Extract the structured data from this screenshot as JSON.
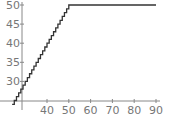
{
  "chart_data": {
    "type": "line",
    "title": "",
    "xlabel": "",
    "ylabel": "",
    "x_ticks": [
      40,
      50,
      60,
      70,
      80,
      90
    ],
    "y_ticks": [
      30,
      35,
      40,
      45,
      50
    ],
    "xlim": [
      27,
      90
    ],
    "ylim": [
      24.7,
      50.5
    ],
    "grid": false,
    "legend": null,
    "series": [
      {
        "name": "step",
        "style": "staircase",
        "x": [
          24,
          25,
          26,
          27,
          28,
          29,
          30,
          31,
          32,
          33,
          34,
          35,
          36,
          37,
          38,
          39,
          40,
          41,
          42,
          43,
          44,
          45,
          46,
          47,
          48,
          49,
          50,
          90
        ],
        "y": [
          24,
          25,
          26,
          27,
          28,
          29,
          30,
          31,
          32,
          33,
          34,
          35,
          36,
          37,
          38,
          39,
          40,
          41,
          42,
          43,
          44,
          45,
          46,
          47,
          48,
          49,
          50,
          50
        ]
      }
    ],
    "colors": {
      "line": "#333333",
      "axis": "#888888",
      "tick_label": "#777777"
    }
  }
}
